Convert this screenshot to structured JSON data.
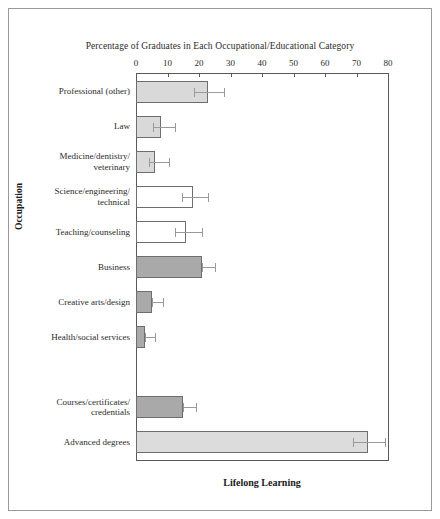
{
  "chart_data": {
    "type": "bar",
    "orientation": "horizontal",
    "title": "Percentage of Graduates in Each Occupational/Educational Category",
    "xlabel": "Lifelong Learning",
    "ylabel": "Occupation",
    "xlim": [
      0,
      80
    ],
    "xticks": [
      0,
      10,
      20,
      30,
      40,
      50,
      60,
      70,
      80
    ],
    "xtick_labels": [
      "0",
      "10",
      "20",
      "30",
      "40",
      "50",
      "60",
      "70",
      "80"
    ],
    "grid": false,
    "legend": "none",
    "axis_position": "top",
    "categories": [
      "Professional (other)",
      "Law",
      "Medicine/dentistry/\nveterinary",
      "Science/engineering/\ntechnical",
      "Teaching/counseling",
      "Business",
      "Creative arts/design",
      "Health/social services",
      "Courses/certificates/\ncredentials",
      "Advanced degrees"
    ],
    "values": [
      22.8,
      8.0,
      6.0,
      18.0,
      16.0,
      21.0,
      5.0,
      3.0,
      15.0,
      73.5
    ],
    "error_low": [
      18.5,
      5.5,
      4.0,
      14.5,
      12.5,
      21.0,
      5.0,
      3.0,
      15.0,
      69.0
    ],
    "error_high": [
      28.0,
      12.5,
      10.5,
      23.0,
      21.0,
      25.0,
      8.5,
      6.0,
      19.0,
      79.0
    ],
    "bar_fills": [
      "#d9d9d9",
      "#d9d9d9",
      "#d9d9d9",
      "#ffffff",
      "#ffffff",
      "#a9a9a9",
      "#a9a9a9",
      "#a9a9a9",
      "#a9a9a9",
      "#dcdcdc"
    ],
    "group_gap_after_index": 7,
    "colors": {
      "bar_edge": "#6e6e6e",
      "error_bar": "#9a9a9a",
      "axis": "#5a5a5a",
      "frame": "#9a9a9a",
      "text": "#2b2b2b"
    }
  }
}
